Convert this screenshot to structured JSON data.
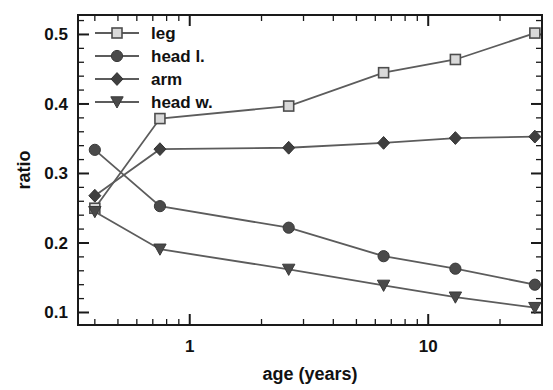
{
  "chart_data": {
    "type": "line",
    "title": "",
    "xlabel": "age (years)",
    "ylabel": "ratio",
    "xscale": "log",
    "yscale": "linear",
    "xlim": [
      0.34,
      30.0
    ],
    "ylim": [
      0.082,
      0.528
    ],
    "grid": false,
    "legend_position": "top-left",
    "x_major_ticks": [
      1,
      10
    ],
    "x_major_tick_labels": [
      "1",
      "10"
    ],
    "y_major_ticks": [
      0.1,
      0.2,
      0.3,
      0.4,
      0.5
    ],
    "y_major_tick_labels": [
      "0.1",
      "0.2",
      "0.3",
      "0.4",
      "0.5"
    ],
    "x": [
      0.4,
      0.75,
      2.6,
      6.5,
      13.0,
      28.0
    ],
    "series": [
      {
        "name": "leg",
        "marker": "square-open",
        "marker_fill": "#d9d9d9",
        "marker_edge": "#4d4d4d",
        "line_color": "#5c5c5c",
        "values": [
          0.25,
          0.379,
          0.397,
          0.445,
          0.464,
          0.502
        ]
      },
      {
        "name": "head l.",
        "marker": "circle-filled",
        "marker_fill": "#4a4a4a",
        "marker_edge": "#3a3a3a",
        "line_color": "#5c5c5c",
        "values": [
          0.334,
          0.253,
          0.222,
          0.181,
          0.163,
          0.14
        ]
      },
      {
        "name": "arm",
        "marker": "diamond-filled",
        "marker_fill": "#3f3f3f",
        "marker_edge": "#333333",
        "line_color": "#5c5c5c",
        "values": [
          0.268,
          0.335,
          0.337,
          0.344,
          0.351,
          0.353
        ]
      },
      {
        "name": "head w.",
        "marker": "triangle-down-filled",
        "marker_fill": "#4a4a4a",
        "marker_edge": "#3a3a3a",
        "line_color": "#5c5c5c",
        "values": [
          0.245,
          0.191,
          0.162,
          0.139,
          0.122,
          0.107
        ]
      }
    ]
  },
  "axes": {
    "ylabel": "ratio",
    "xlabel": "age (years)",
    "x_tick_labels": [
      "1",
      "10"
    ],
    "y_tick_labels": [
      "0.5",
      "0.4",
      "0.3",
      "0.2",
      "0.1"
    ]
  },
  "legend": {
    "entries": [
      {
        "label": "leg"
      },
      {
        "label": "head l."
      },
      {
        "label": "arm"
      },
      {
        "label": "head w."
      }
    ]
  }
}
